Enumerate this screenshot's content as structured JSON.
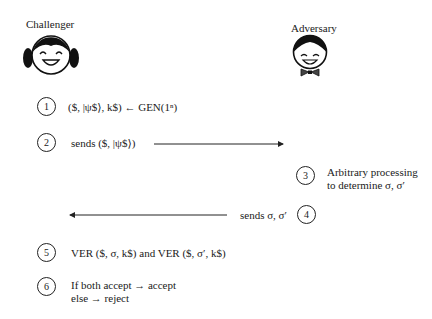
{
  "actors": {
    "challenger": {
      "label": "Challenger",
      "icon": "girl-face-icon"
    },
    "adversary": {
      "label": "Adversary",
      "icon": "boy-face-bowtie-icon"
    }
  },
  "steps": [
    {
      "number": "1",
      "text": "($, |ψ$⟩, k$) ← GEN(1ⁿ)",
      "side": "challenger"
    },
    {
      "number": "2",
      "text": "sends ($, |ψ$⟩)",
      "side": "challenger",
      "arrow": "to-adversary"
    },
    {
      "number": "3",
      "text_line1": "Arbitrary processing",
      "text_line2": "to determine σ, σ′",
      "side": "adversary"
    },
    {
      "number": "4",
      "text": "sends σ, σ′",
      "side": "adversary",
      "arrow": "to-challenger"
    },
    {
      "number": "5",
      "text": "VER ($, σ, k$) and VER ($, σ′, k$)",
      "side": "challenger"
    },
    {
      "number": "6",
      "text_line1": "If  both accept → accept",
      "text_line2": "else → reject",
      "side": "challenger"
    }
  ]
}
